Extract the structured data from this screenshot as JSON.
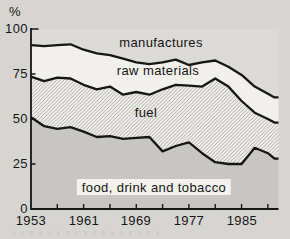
{
  "figure": {
    "unit_label": "%"
  },
  "colors": {
    "page_bg": "#d6d5d1",
    "food_band": "#c7c6c2",
    "raw_band": "#f1f0ec",
    "manufactures_band": "#dbdad6",
    "hatch_line": "#9b9a96",
    "hatch_bg": "#f1f0ec",
    "line": "#161616",
    "text": "#1b1b1b",
    "label_box_bg": "#f3f2ee"
  },
  "chart_data": {
    "type": "area",
    "stacked": true,
    "title": "",
    "ylabel": "%",
    "xlabel": "",
    "grid": false,
    "legend_position": "labels-inside-bands",
    "ylim": [
      0,
      100
    ],
    "xlim": [
      1953,
      1990.5
    ],
    "yticks": [
      0,
      25,
      50,
      75,
      100
    ],
    "ytick_labels": [
      "0",
      "25",
      "50",
      "75",
      "100"
    ],
    "xticks_major": [
      1953,
      1961,
      1969,
      1977,
      1985
    ],
    "xtick_labels": [
      "1953",
      "1961",
      "1969",
      "1977",
      "1985"
    ],
    "xticks_minor": [
      1957,
      1965,
      1973,
      1981,
      1989
    ],
    "x": [
      1953,
      1955,
      1957,
      1959,
      1961,
      1963,
      1965,
      1967,
      1969,
      1971,
      1973,
      1975,
      1977,
      1979,
      1981,
      1983,
      1985,
      1987,
      1989,
      1990
    ],
    "series": [
      {
        "name": "food, drink and tobacco",
        "fill_key": "stipple-gray",
        "values": [
          51,
          46,
          44.5,
          45.5,
          43,
          40,
          40.5,
          39,
          39.5,
          40,
          32,
          35,
          37,
          31,
          26,
          25,
          25,
          34,
          31,
          28
        ]
      },
      {
        "name": "fuel",
        "fill_key": "diagonal-hatch",
        "values": [
          22.5,
          25,
          28.5,
          27,
          26,
          26.5,
          27.5,
          24.5,
          25.5,
          23.5,
          34.5,
          34,
          31.5,
          37,
          46.5,
          43,
          35,
          19.5,
          19,
          20
        ]
      },
      {
        "name": "raw materials",
        "fill_key": "white",
        "values": [
          17.5,
          19.5,
          18,
          19,
          19.5,
          20,
          17.5,
          20,
          16.5,
          17,
          15,
          14,
          11.5,
          13.5,
          10,
          11,
          14.5,
          14.5,
          14,
          14
        ]
      },
      {
        "name": "manufactures",
        "fill_key": "light-gray",
        "values": [
          9,
          9.5,
          9,
          8.5,
          11.5,
          13.5,
          14.5,
          16.5,
          18.5,
          19.5,
          18.5,
          17,
          20,
          18.5,
          17.5,
          21,
          25.5,
          32,
          36,
          38
        ]
      }
    ]
  }
}
